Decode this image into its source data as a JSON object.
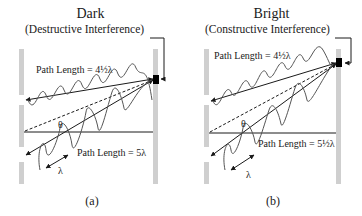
{
  "panels": [
    {
      "id": "a",
      "title": "Dark",
      "subtitle": "(Destructive Interference)",
      "path_top": "Path Length = 4½λ",
      "path_bottom": "Path Length = 5λ",
      "angle_label": "θ",
      "wavelength_label": "λ",
      "caption": "(a)"
    },
    {
      "id": "b",
      "title": "Bright",
      "subtitle": "(Constructive Interference)",
      "path_top": "Path Length = 4½λ",
      "path_bottom": "Path Length = 5½λ",
      "angle_label": "θ",
      "wavelength_label": "λ",
      "caption": "(b)"
    }
  ],
  "colors": {
    "barrier": "#cfcfcf",
    "line": "#1a1a1a",
    "wave": "#555555",
    "detector": "#000000"
  }
}
